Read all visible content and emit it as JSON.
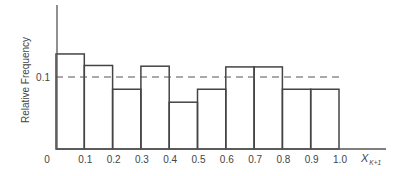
{
  "chart_data": {
    "type": "bar",
    "subtype": "histogram",
    "title": "",
    "xlabel": "X_{K+1}",
    "xlabel_main": "X",
    "xlabel_sub": "K+1",
    "ylabel": "Relative Frequency",
    "bin_edges": [
      0,
      0.1,
      0.2,
      0.3,
      0.4,
      0.5,
      0.6,
      0.7,
      0.8,
      0.9,
      1.0
    ],
    "categories": [
      "0.0-0.1",
      "0.1-0.2",
      "0.2-0.3",
      "0.3-0.4",
      "0.4-0.5",
      "0.5-0.6",
      "0.6-0.7",
      "0.7-0.8",
      "0.8-0.9",
      "0.9-1.0"
    ],
    "values": [
      0.132,
      0.116,
      0.083,
      0.115,
      0.065,
      0.083,
      0.114,
      0.114,
      0.083,
      0.083
    ],
    "x_tick_labels": [
      "0",
      "0.1",
      "0.2",
      "0.3",
      "0.4",
      "0.5",
      "0.6",
      "0.7",
      "0.8",
      "0.9",
      "1.0"
    ],
    "y_tick_labels": [
      "0.1"
    ],
    "reference_line": {
      "y": 0.1,
      "style": "dashed"
    },
    "xlim": [
      0,
      1.0
    ],
    "ylim": [
      0,
      0.2
    ],
    "grid": false,
    "legend": null
  }
}
